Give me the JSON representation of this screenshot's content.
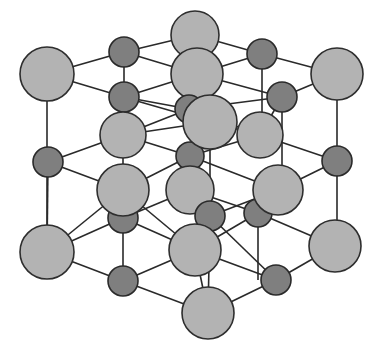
{
  "diagram": {
    "type": "crystal-lattice",
    "colors": {
      "large_atom_fill": "#b3b3b3",
      "small_atom_fill": "#7f7f7f",
      "outline": "#2e2e2e",
      "bond": "#2a2a2a",
      "background": "#ffffff"
    },
    "bonds": [
      [
        47,
        74,
        124,
        52
      ],
      [
        124,
        52,
        195,
        35
      ],
      [
        195,
        35,
        262,
        54
      ],
      [
        262,
        54,
        337,
        74
      ],
      [
        47,
        74,
        124,
        97
      ],
      [
        124,
        97,
        197,
        74
      ],
      [
        197,
        74,
        282,
        97
      ],
      [
        282,
        97,
        337,
        74
      ],
      [
        124,
        52,
        124,
        97
      ],
      [
        262,
        54,
        262,
        135
      ],
      [
        195,
        35,
        197,
        74
      ],
      [
        124,
        97,
        189,
        109
      ],
      [
        197,
        74,
        189,
        109
      ],
      [
        197,
        74,
        262,
        54
      ],
      [
        124,
        52,
        197,
        74
      ],
      [
        189,
        109,
        282,
        97
      ],
      [
        189,
        109,
        123,
        135
      ],
      [
        189,
        109,
        260,
        135
      ],
      [
        124,
        97,
        123,
        135
      ],
      [
        282,
        97,
        260,
        135
      ],
      [
        282,
        97,
        282,
        190
      ],
      [
        47,
        74,
        47,
        252
      ],
      [
        337,
        74,
        337,
        246
      ],
      [
        123,
        135,
        210,
        122
      ],
      [
        210,
        122,
        260,
        135
      ],
      [
        210,
        122,
        123,
        97
      ],
      [
        123,
        135,
        48,
        162
      ],
      [
        48,
        162,
        123,
        190
      ],
      [
        123,
        135,
        190,
        156
      ],
      [
        260,
        135,
        190,
        156
      ],
      [
        260,
        135,
        337,
        161
      ],
      [
        337,
        161,
        278,
        190
      ],
      [
        190,
        156,
        123,
        190
      ],
      [
        190,
        156,
        278,
        190
      ],
      [
        210,
        122,
        210,
        216
      ],
      [
        123,
        97,
        123,
        281
      ],
      [
        190,
        156,
        190,
        190
      ],
      [
        123,
        190,
        47,
        252
      ],
      [
        123,
        190,
        195,
        250
      ],
      [
        48,
        162,
        47,
        252
      ],
      [
        190,
        190,
        210,
        216
      ],
      [
        190,
        190,
        258,
        213
      ],
      [
        190,
        190,
        123,
        218
      ],
      [
        278,
        190,
        210,
        216
      ],
      [
        278,
        190,
        258,
        213
      ],
      [
        258,
        213,
        335,
        246
      ],
      [
        258,
        213,
        195,
        250
      ],
      [
        123,
        218,
        47,
        252
      ],
      [
        123,
        218,
        195,
        250
      ],
      [
        210,
        216,
        195,
        250
      ],
      [
        210,
        216,
        276,
        280
      ],
      [
        47,
        252,
        123,
        281
      ],
      [
        123,
        281,
        195,
        250
      ],
      [
        123,
        281,
        208,
        313
      ],
      [
        195,
        250,
        276,
        280
      ],
      [
        276,
        280,
        335,
        246
      ],
      [
        276,
        280,
        208,
        313
      ],
      [
        258,
        213,
        258,
        280
      ],
      [
        195,
        250,
        208,
        313
      ],
      [
        210,
        216,
        208,
        313
      ]
    ],
    "atoms_back": [
      {
        "kind": "large",
        "cx": 195,
        "cy": 35,
        "r": 24
      },
      {
        "kind": "small",
        "cx": 124,
        "cy": 52,
        "r": 15
      },
      {
        "kind": "small",
        "cx": 262,
        "cy": 54,
        "r": 15
      },
      {
        "kind": "large",
        "cx": 47,
        "cy": 74,
        "r": 27
      },
      {
        "kind": "large",
        "cx": 337,
        "cy": 74,
        "r": 26
      },
      {
        "kind": "large",
        "cx": 197,
        "cy": 74,
        "r": 26
      },
      {
        "kind": "small",
        "cx": 124,
        "cy": 97,
        "r": 15
      },
      {
        "kind": "small",
        "cx": 282,
        "cy": 97,
        "r": 15
      },
      {
        "kind": "small",
        "cx": 189,
        "cy": 109,
        "r": 14
      },
      {
        "kind": "large",
        "cx": 123,
        "cy": 135,
        "r": 23
      },
      {
        "kind": "large",
        "cx": 260,
        "cy": 135,
        "r": 23
      },
      {
        "kind": "small",
        "cx": 48,
        "cy": 162,
        "r": 15
      },
      {
        "kind": "small",
        "cx": 337,
        "cy": 161,
        "r": 15
      },
      {
        "kind": "small",
        "cx": 190,
        "cy": 156,
        "r": 14
      },
      {
        "kind": "large",
        "cx": 210,
        "cy": 122,
        "r": 27
      }
    ],
    "atoms_front": [
      {
        "kind": "small",
        "cx": 123,
        "cy": 218,
        "r": 15
      },
      {
        "kind": "small",
        "cx": 258,
        "cy": 213,
        "r": 14
      },
      {
        "kind": "large",
        "cx": 190,
        "cy": 190,
        "r": 24
      },
      {
        "kind": "large",
        "cx": 123,
        "cy": 190,
        "r": 26
      },
      {
        "kind": "large",
        "cx": 278,
        "cy": 190,
        "r": 25
      },
      {
        "kind": "small",
        "cx": 210,
        "cy": 216,
        "r": 15
      },
      {
        "kind": "large",
        "cx": 47,
        "cy": 252,
        "r": 27
      },
      {
        "kind": "large",
        "cx": 335,
        "cy": 246,
        "r": 26
      },
      {
        "kind": "large",
        "cx": 195,
        "cy": 250,
        "r": 26
      },
      {
        "kind": "small",
        "cx": 123,
        "cy": 281,
        "r": 15
      },
      {
        "kind": "small",
        "cx": 276,
        "cy": 280,
        "r": 15
      },
      {
        "kind": "large",
        "cx": 208,
        "cy": 313,
        "r": 26
      }
    ]
  }
}
